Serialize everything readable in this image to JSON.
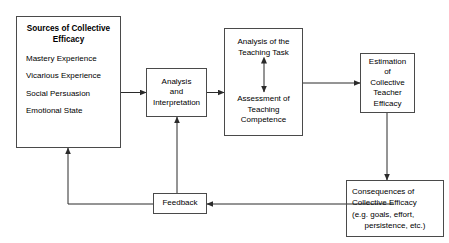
{
  "diagram": {
    "background_color": "#ffffff",
    "line_color": "#4a4a4a",
    "text_color": "#000000",
    "nodes": {
      "sources": {
        "title": "Sources of Collective\nEfficacy",
        "items": [
          "Mastery Experience",
          "Vicarious Experience",
          "Social Persuasion",
          "Emotional State"
        ]
      },
      "analysis": {
        "label": "Analysis\nand\nInterpretation"
      },
      "teaching_task": {
        "label": "Analysis of the\nTeaching Task"
      },
      "teaching_competence": {
        "label": "Assessment of\nTeaching\nCompetence"
      },
      "estimation": {
        "label": "Estimation\nof\nCollective\nTeacher\nEfficacy"
      },
      "consequences": {
        "line1": "Consequences of",
        "line2": "Collective Efficacy",
        "line3": "(e.g. goals, effort,",
        "line4": "persistence, etc.)"
      },
      "feedback": {
        "label": "Feedback"
      }
    },
    "edges": [
      {
        "name": "sources-to-analysis",
        "from": "sources",
        "to": "analysis",
        "arrow": "single"
      },
      {
        "name": "analysis-to-teaching",
        "from": "analysis",
        "to": "teaching_task_box",
        "arrow": "single"
      },
      {
        "name": "task-competence-bidirectional",
        "from": "teaching_task",
        "to": "teaching_competence",
        "arrow": "double"
      },
      {
        "name": "teaching-to-estimation",
        "from": "teaching_task_box",
        "to": "estimation",
        "arrow": "single"
      },
      {
        "name": "estimation-to-consequences",
        "from": "estimation",
        "to": "consequences",
        "arrow": "single"
      },
      {
        "name": "consequences-to-feedback",
        "from": "consequences",
        "to": "feedback",
        "arrow": "single"
      },
      {
        "name": "feedback-to-sources",
        "from": "feedback",
        "to": "sources",
        "arrow": "single"
      },
      {
        "name": "feedback-to-analysis",
        "from": "feedback",
        "to": "analysis",
        "arrow": "single"
      }
    ]
  }
}
